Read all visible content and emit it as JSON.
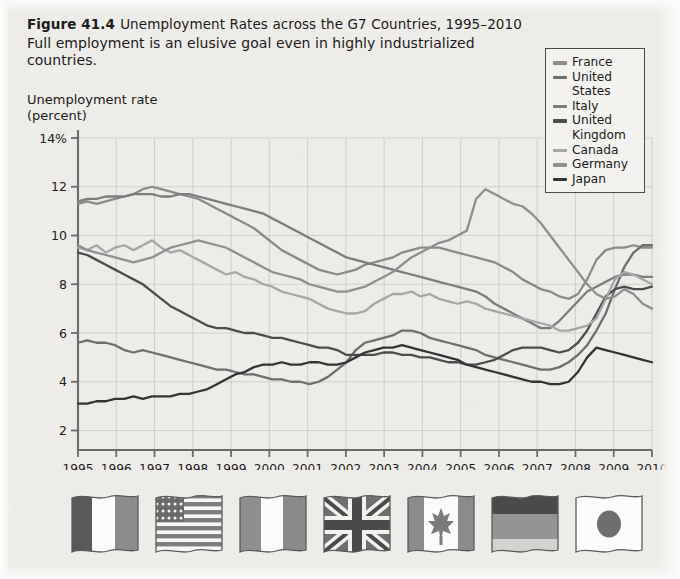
{
  "figure": {
    "label": "Figure 41.4",
    "title": "Unemployment Rates across the G7 Countries, 1995–2010",
    "subtitle": "Full employment is an elusive goal even in highly industrialized countries."
  },
  "axis": {
    "y_title": "Unemployment rate\n(percent)",
    "y_ticks": [
      "2",
      "4",
      "6",
      "8",
      "10",
      "12",
      "14%"
    ],
    "x_ticks": [
      "1995",
      "1996",
      "1997",
      "1998",
      "1999",
      "2000",
      "2001",
      "2002",
      "2003",
      "2004",
      "2005",
      "2006",
      "2007",
      "2008",
      "2009",
      "2010"
    ]
  },
  "legend": {
    "items": [
      {
        "label": "France",
        "color": "#8a8a8a"
      },
      {
        "label": "United\nStates",
        "color": "#6e6e6e"
      },
      {
        "label": "Italy",
        "color": "#7c7c7c"
      },
      {
        "label": "United\nKingdom",
        "color": "#4c4c4c"
      },
      {
        "label": "Canada",
        "color": "#a6a6a6"
      },
      {
        "label": "Germany",
        "color": "#8f8f8f"
      },
      {
        "label": "Japan",
        "color": "#333333"
      }
    ]
  },
  "flags": [
    {
      "country": "France",
      "name": "flag-france"
    },
    {
      "country": "United States",
      "name": "flag-united-states"
    },
    {
      "country": "Italy",
      "name": "flag-italy"
    },
    {
      "country": "United Kingdom",
      "name": "flag-united-kingdom"
    },
    {
      "country": "Canada",
      "name": "flag-canada"
    },
    {
      "country": "Germany",
      "name": "flag-germany"
    },
    {
      "country": "Japan",
      "name": "flag-japan"
    }
  ],
  "chart_data": {
    "type": "line",
    "title": "Unemployment Rates across the G7 Countries, 1995–2010",
    "xlabel": "",
    "ylabel": "Unemployment rate (percent)",
    "xlim": [
      1995,
      2010
    ],
    "ylim": [
      1.2,
      14
    ],
    "yticks": [
      2,
      4,
      6,
      8,
      10,
      12,
      14
    ],
    "xticks": [
      1995,
      1996,
      1997,
      1998,
      1999,
      2000,
      2001,
      2002,
      2003,
      2004,
      2005,
      2006,
      2007,
      2008,
      2009,
      2010
    ],
    "grid": true,
    "legend_position": "top-right",
    "x_step_years": 0.25,
    "series": [
      {
        "name": "France",
        "color": "#8a8a8a",
        "values": [
          11.3,
          11.4,
          11.3,
          11.4,
          11.5,
          11.6,
          11.7,
          11.9,
          12.0,
          11.9,
          11.8,
          11.7,
          11.6,
          11.5,
          11.3,
          11.1,
          10.9,
          10.7,
          10.5,
          10.3,
          10.0,
          9.7,
          9.4,
          9.2,
          9.0,
          8.8,
          8.6,
          8.5,
          8.4,
          8.5,
          8.6,
          8.8,
          8.9,
          9.0,
          9.1,
          9.3,
          9.4,
          9.5,
          9.5,
          9.5,
          9.4,
          9.3,
          9.2,
          9.1,
          9.0,
          8.9,
          8.7,
          8.5,
          8.2,
          8.0,
          7.8,
          7.7,
          7.5,
          7.4,
          7.6,
          8.2,
          9.0,
          9.4,
          9.5,
          9.5,
          9.6,
          9.5,
          9.5
        ]
      },
      {
        "name": "United States",
        "color": "#6e6e6e",
        "values": [
          5.6,
          5.7,
          5.6,
          5.6,
          5.5,
          5.3,
          5.2,
          5.3,
          5.2,
          5.1,
          5.0,
          4.9,
          4.8,
          4.7,
          4.6,
          4.5,
          4.5,
          4.4,
          4.3,
          4.3,
          4.2,
          4.1,
          4.1,
          4.0,
          4.0,
          3.9,
          4.0,
          4.2,
          4.5,
          4.8,
          5.3,
          5.6,
          5.7,
          5.8,
          5.9,
          6.1,
          6.1,
          6.0,
          5.8,
          5.7,
          5.6,
          5.5,
          5.4,
          5.3,
          5.1,
          5.0,
          4.9,
          4.8,
          4.7,
          4.6,
          4.5,
          4.5,
          4.6,
          4.8,
          5.1,
          5.5,
          6.1,
          6.8,
          7.8,
          8.7,
          9.3,
          9.6,
          9.6
        ]
      },
      {
        "name": "Italy",
        "color": "#7c7c7c",
        "values": [
          11.4,
          11.5,
          11.5,
          11.6,
          11.6,
          11.6,
          11.7,
          11.7,
          11.7,
          11.6,
          11.6,
          11.7,
          11.7,
          11.6,
          11.5,
          11.4,
          11.3,
          11.2,
          11.1,
          11.0,
          10.9,
          10.7,
          10.5,
          10.3,
          10.1,
          9.9,
          9.7,
          9.5,
          9.3,
          9.1,
          9.0,
          8.9,
          8.8,
          8.7,
          8.6,
          8.5,
          8.4,
          8.3,
          8.2,
          8.1,
          8.0,
          7.9,
          7.8,
          7.7,
          7.5,
          7.2,
          7.0,
          6.8,
          6.6,
          6.4,
          6.2,
          6.2,
          6.5,
          6.9,
          7.3,
          7.7,
          7.9,
          8.1,
          8.3,
          8.4,
          8.4,
          8.3,
          8.3
        ]
      },
      {
        "name": "United Kingdom",
        "color": "#4c4c4c",
        "values": [
          9.3,
          9.2,
          9.0,
          8.8,
          8.6,
          8.4,
          8.2,
          8.0,
          7.7,
          7.4,
          7.1,
          6.9,
          6.7,
          6.5,
          6.3,
          6.2,
          6.2,
          6.1,
          6.0,
          6.0,
          5.9,
          5.8,
          5.8,
          5.7,
          5.6,
          5.5,
          5.4,
          5.4,
          5.3,
          5.1,
          5.1,
          5.1,
          5.1,
          5.2,
          5.2,
          5.1,
          5.1,
          5.0,
          5.0,
          4.9,
          4.8,
          4.8,
          4.7,
          4.7,
          4.8,
          4.9,
          5.1,
          5.3,
          5.4,
          5.4,
          5.4,
          5.3,
          5.2,
          5.3,
          5.6,
          6.1,
          6.8,
          7.5,
          7.8,
          7.9,
          7.8,
          7.8,
          7.9
        ]
      },
      {
        "name": "Canada",
        "color": "#a6a6a6",
        "values": [
          9.5,
          9.4,
          9.6,
          9.3,
          9.5,
          9.6,
          9.4,
          9.6,
          9.8,
          9.5,
          9.3,
          9.4,
          9.2,
          9.0,
          8.8,
          8.6,
          8.4,
          8.5,
          8.3,
          8.2,
          8.0,
          7.9,
          7.7,
          7.6,
          7.5,
          7.4,
          7.2,
          7.0,
          6.9,
          6.8,
          6.8,
          6.9,
          7.2,
          7.4,
          7.6,
          7.6,
          7.7,
          7.5,
          7.6,
          7.4,
          7.3,
          7.2,
          7.3,
          7.2,
          7.0,
          6.9,
          6.8,
          6.7,
          6.6,
          6.5,
          6.4,
          6.3,
          6.1,
          6.1,
          6.2,
          6.3,
          6.6,
          7.4,
          8.2,
          8.5,
          8.4,
          8.2,
          8.0
        ]
      },
      {
        "name": "Germany",
        "color": "#8f8f8f",
        "values": [
          9.6,
          9.4,
          9.3,
          9.2,
          9.1,
          9.0,
          8.9,
          9.0,
          9.1,
          9.3,
          9.5,
          9.6,
          9.7,
          9.8,
          9.7,
          9.6,
          9.5,
          9.3,
          9.1,
          8.9,
          8.7,
          8.5,
          8.4,
          8.3,
          8.2,
          8.0,
          7.9,
          7.8,
          7.7,
          7.7,
          7.8,
          7.9,
          8.1,
          8.3,
          8.5,
          8.8,
          9.1,
          9.3,
          9.5,
          9.7,
          9.8,
          10.0,
          10.2,
          11.5,
          11.9,
          11.7,
          11.5,
          11.3,
          11.2,
          10.9,
          10.5,
          10.0,
          9.5,
          9.0,
          8.5,
          8.0,
          7.6,
          7.4,
          7.5,
          7.8,
          7.6,
          7.2,
          7.0
        ]
      },
      {
        "name": "Japan",
        "color": "#333333",
        "values": [
          3.1,
          3.1,
          3.2,
          3.2,
          3.3,
          3.3,
          3.4,
          3.3,
          3.4,
          3.4,
          3.4,
          3.5,
          3.5,
          3.6,
          3.7,
          3.9,
          4.1,
          4.3,
          4.4,
          4.6,
          4.7,
          4.7,
          4.8,
          4.7,
          4.7,
          4.8,
          4.8,
          4.7,
          4.7,
          4.8,
          5.0,
          5.2,
          5.3,
          5.4,
          5.4,
          5.5,
          5.4,
          5.3,
          5.2,
          5.1,
          5.0,
          4.9,
          4.7,
          4.6,
          4.5,
          4.4,
          4.3,
          4.2,
          4.1,
          4.0,
          4.0,
          3.9,
          3.9,
          4.0,
          4.4,
          5.0,
          5.4,
          5.3,
          5.2,
          5.1,
          5.0,
          4.9,
          4.8
        ]
      }
    ]
  }
}
